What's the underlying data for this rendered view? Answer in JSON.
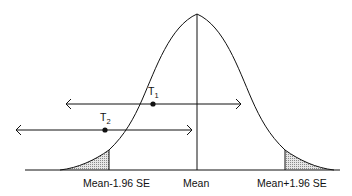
{
  "diagram": {
    "type": "normal-distribution-confidence-interval",
    "colors": {
      "stroke": "#111111",
      "shade": "#bdbdbd",
      "background": "#ffffff"
    },
    "axis_labels": {
      "left": "Mean-1.96 SE",
      "center": "Mean",
      "right": "Mean+1.96 SE"
    },
    "points": [
      {
        "id": "T1",
        "letter": "T",
        "subscript": "1",
        "x": 153,
        "y": 104,
        "interval": [
          66,
          241
        ]
      },
      {
        "id": "T2",
        "letter": "T",
        "subscript": "2",
        "x": 105,
        "y": 130,
        "interval": [
          16,
          192
        ]
      }
    ]
  }
}
